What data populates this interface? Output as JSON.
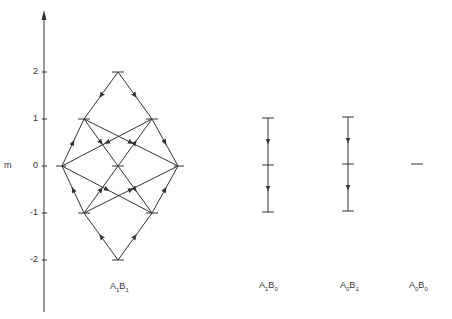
{
  "axis": {
    "label": "m",
    "ticks": [
      {
        "value": 2,
        "label": "2",
        "y": 72
      },
      {
        "value": 1,
        "label": "1",
        "y": 119
      },
      {
        "value": 0,
        "label": "0",
        "y": 166
      },
      {
        "value": -1,
        "label": "-1",
        "y": 213
      },
      {
        "value": -2,
        "label": "-2",
        "y": 260
      }
    ]
  },
  "diagrams": [
    {
      "name": "A1B1",
      "label_a": "A",
      "sub_a": "1",
      "label_b": "B",
      "sub_b": "1",
      "levels": [
        2,
        1,
        0,
        -1,
        -2
      ]
    },
    {
      "name": "A1B0",
      "label_a": "A",
      "sub_a": "1",
      "label_b": "B",
      "sub_b": "0",
      "levels": [
        1,
        0,
        -1
      ]
    },
    {
      "name": "A0B1",
      "label_a": "A",
      "sub_a": "0",
      "label_b": "B",
      "sub_b": "1",
      "levels": [
        1,
        0,
        -1
      ]
    },
    {
      "name": "A0B0",
      "label_a": "A",
      "sub_a": "0",
      "label_b": "B",
      "sub_b": "0",
      "levels": [
        0
      ]
    }
  ],
  "colors": {
    "line": "#333333",
    "background": "#ffffff"
  }
}
